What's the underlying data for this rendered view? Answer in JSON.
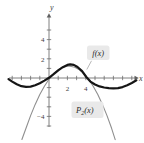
{
  "figure": {
    "f_label": {
      "text": "f(x)"
    },
    "p2_label": {
      "base": "P",
      "sub": "2",
      "rest": "(x)"
    }
  },
  "colors": {
    "background": "#ffffff",
    "axis": "#606060",
    "tick": "#6b6b6b",
    "tick_text": "#3d3d3d",
    "f_curve": "#161616",
    "p2_curve": "#8f8f8f",
    "label_box_bg": "#e9e9e9",
    "leader_line": "#9a9a9a"
  },
  "chart_data": {
    "type": "line",
    "title": "",
    "xlabel": "x",
    "ylabel": "y",
    "xlim": [
      -4.8,
      10.3
    ],
    "ylim": [
      -6.9,
      6.7
    ],
    "grid": false,
    "legend_position": "inline-labels",
    "x_ticks": [
      -4,
      -3,
      -2,
      -1,
      1,
      2,
      3,
      4,
      5,
      6,
      7,
      8,
      9
    ],
    "y_ticks": [
      -5,
      -4,
      -3,
      -2,
      -1,
      1,
      2,
      3,
      4,
      5
    ],
    "x_tick_labels": [
      {
        "value": 2,
        "label": "2"
      },
      {
        "value": 4,
        "label": "4"
      }
    ],
    "y_tick_labels": [
      {
        "value": 4,
        "label": "4"
      },
      {
        "value": 2,
        "label": "2"
      },
      {
        "value": -4,
        "label": "−4"
      }
    ],
    "series": [
      {
        "name": "f(x)",
        "color": "#8f8f8f",
        "stroke_width": 1.1,
        "points": [
          [
            -2.95,
            -6.41
          ],
          [
            -2.5,
            -5.24
          ],
          [
            -2.0,
            -3.92
          ],
          [
            -1.5,
            -2.75
          ],
          [
            -1.0,
            -1.73
          ],
          [
            -0.5,
            -0.86
          ],
          [
            0.0,
            -0.14
          ],
          [
            0.5,
            0.43
          ],
          [
            1.0,
            0.85
          ],
          [
            1.5,
            1.12
          ],
          [
            2.15,
            1.25
          ],
          [
            2.8,
            1.12
          ],
          [
            3.3,
            0.85
          ],
          [
            3.8,
            0.43
          ],
          [
            4.3,
            -0.14
          ],
          [
            4.8,
            -0.86
          ],
          [
            5.3,
            -1.73
          ],
          [
            5.8,
            -2.75
          ],
          [
            6.3,
            -3.92
          ],
          [
            6.8,
            -5.24
          ],
          [
            7.2,
            -6.42
          ]
        ],
        "series_id": "p2-curve"
      },
      {
        "name": "P2(x)",
        "color": "#161616",
        "stroke_width": 2.2,
        "points": [
          [
            -4.4,
            -0.12
          ],
          [
            -4.0,
            -0.38
          ],
          [
            -3.5,
            -0.66
          ],
          [
            -3.0,
            -0.85
          ],
          [
            -2.5,
            -0.93
          ],
          [
            -2.0,
            -0.9
          ],
          [
            -1.5,
            -0.76
          ],
          [
            -1.0,
            -0.54
          ],
          [
            -0.5,
            -0.27
          ],
          [
            0.0,
            0.02
          ],
          [
            0.5,
            0.4
          ],
          [
            1.0,
            0.8
          ],
          [
            1.5,
            1.12
          ],
          [
            2.0,
            1.36
          ],
          [
            2.3,
            1.42
          ],
          [
            2.7,
            1.36
          ],
          [
            3.1,
            1.15
          ],
          [
            3.6,
            0.72
          ],
          [
            4.05,
            0.1
          ],
          [
            4.5,
            -0.38
          ],
          [
            5.0,
            -0.68
          ],
          [
            5.5,
            -0.88
          ],
          [
            6.0,
            -0.99
          ],
          [
            6.5,
            -1.06
          ],
          [
            7.0,
            -1.08
          ],
          [
            7.5,
            -1.05
          ],
          [
            8.0,
            -0.95
          ],
          [
            8.5,
            -0.76
          ],
          [
            9.0,
            -0.52
          ],
          [
            9.5,
            -0.24
          ]
        ],
        "series_id": "f-curve"
      }
    ]
  }
}
